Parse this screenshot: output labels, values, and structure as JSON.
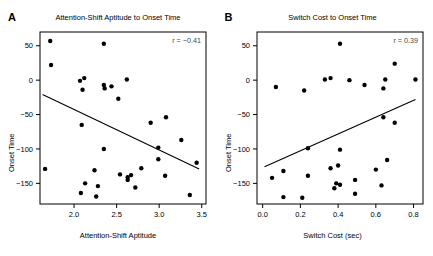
{
  "figure": {
    "background": "#ffffff",
    "point_color": "#000000",
    "line_color": "#000000"
  },
  "panels": [
    {
      "letter": "A",
      "title": "Attention-Shift Aptitude to Onset Time",
      "xlabel": "Attention-Shift Aptitude",
      "ylabel": "Onset Time",
      "annotation": "r = −0.41"
    },
    {
      "letter": "B",
      "title": "Switch Cost to Onset Time",
      "xlabel": "Switch Cost (sec)",
      "ylabel": "Onset Time",
      "annotation": "r = 0.39"
    }
  ],
  "chart_data": [
    {
      "type": "scatter",
      "panel": "A",
      "title": "Attention-Shift Aptitude to Onset Time",
      "xlabel": "Attention-Shift Aptitude",
      "ylabel": "Onset Time",
      "xlim": [
        1.6,
        3.55
      ],
      "ylim": [
        -180,
        70
      ],
      "xticks": [
        2.0,
        2.5,
        3.0,
        3.5
      ],
      "xticklabels": [
        "2.0",
        "2.5",
        "3.0",
        "3.5"
      ],
      "yticks": [
        50,
        0,
        -50,
        -100,
        -150
      ],
      "yticklabels": [
        "50",
        "0",
        "−50",
        "−100",
        "−150"
      ],
      "grid": false,
      "legend": false,
      "annotation": "r = −0.41",
      "correlation": -0.41,
      "trendline": {
        "x0": 1.63,
        "y0": -21,
        "x1": 3.47,
        "y1": -129
      },
      "points": [
        {
          "x": 1.72,
          "y": 57
        },
        {
          "x": 1.73,
          "y": 22
        },
        {
          "x": 2.35,
          "y": 53
        },
        {
          "x": 2.07,
          "y": -1
        },
        {
          "x": 2.12,
          "y": 3
        },
        {
          "x": 2.62,
          "y": 1
        },
        {
          "x": 2.35,
          "y": -7
        },
        {
          "x": 2.36,
          "y": -12
        },
        {
          "x": 2.44,
          "y": -9
        },
        {
          "x": 2.1,
          "y": -14
        },
        {
          "x": 2.52,
          "y": -27
        },
        {
          "x": 2.9,
          "y": -62
        },
        {
          "x": 3.08,
          "y": -54
        },
        {
          "x": 2.09,
          "y": -65
        },
        {
          "x": 3.26,
          "y": -87
        },
        {
          "x": 2.35,
          "y": -100
        },
        {
          "x": 2.99,
          "y": -98
        },
        {
          "x": 2.99,
          "y": -115
        },
        {
          "x": 3.44,
          "y": -120
        },
        {
          "x": 1.66,
          "y": -129
        },
        {
          "x": 2.79,
          "y": -128
        },
        {
          "x": 2.24,
          "y": -131
        },
        {
          "x": 2.54,
          "y": -137
        },
        {
          "x": 2.67,
          "y": -138
        },
        {
          "x": 2.63,
          "y": -141
        },
        {
          "x": 2.63,
          "y": -145
        },
        {
          "x": 3.07,
          "y": -139
        },
        {
          "x": 2.72,
          "y": -156
        },
        {
          "x": 2.13,
          "y": -150
        },
        {
          "x": 2.28,
          "y": -154
        },
        {
          "x": 2.08,
          "y": -164
        },
        {
          "x": 2.26,
          "y": -169
        },
        {
          "x": 3.36,
          "y": -167
        }
      ]
    },
    {
      "type": "scatter",
      "panel": "B",
      "title": "Switch Cost to Onset Time",
      "xlabel": "Switch Cost (sec)",
      "ylabel": "Onset Time",
      "xlim": [
        -0.03,
        0.85
      ],
      "ylim": [
        -180,
        70
      ],
      "xticks": [
        0.0,
        0.2,
        0.4,
        0.6,
        0.8
      ],
      "xticklabels": [
        "0.0",
        "0.2",
        "0.4",
        "0.6",
        "0.8"
      ],
      "yticks": [
        50,
        0,
        -50,
        -100,
        -150
      ],
      "yticklabels": [
        "50",
        "0",
        "−50",
        "−100",
        "−150"
      ],
      "grid": false,
      "legend": false,
      "annotation": "r = 0.39",
      "correlation": 0.39,
      "trendline": {
        "x0": 0.01,
        "y0": -126,
        "x1": 0.81,
        "y1": -28
      },
      "points": [
        {
          "x": 0.41,
          "y": 53
        },
        {
          "x": 0.7,
          "y": 24
        },
        {
          "x": 0.33,
          "y": 1
        },
        {
          "x": 0.36,
          "y": 3
        },
        {
          "x": 0.46,
          "y": 0
        },
        {
          "x": 0.65,
          "y": 1
        },
        {
          "x": 0.81,
          "y": 1
        },
        {
          "x": 0.07,
          "y": -10
        },
        {
          "x": 0.22,
          "y": -15
        },
        {
          "x": 0.54,
          "y": -7
        },
        {
          "x": 0.64,
          "y": -12
        },
        {
          "x": 0.64,
          "y": -54
        },
        {
          "x": 0.7,
          "y": -62
        },
        {
          "x": 0.24,
          "y": -99
        },
        {
          "x": 0.41,
          "y": -101
        },
        {
          "x": 0.66,
          "y": -116
        },
        {
          "x": 0.36,
          "y": -128
        },
        {
          "x": 0.4,
          "y": -124
        },
        {
          "x": 0.6,
          "y": -130
        },
        {
          "x": 0.11,
          "y": -132
        },
        {
          "x": 0.05,
          "y": -142
        },
        {
          "x": 0.24,
          "y": -139
        },
        {
          "x": 0.49,
          "y": -145
        },
        {
          "x": 0.39,
          "y": -150
        },
        {
          "x": 0.41,
          "y": -152
        },
        {
          "x": 0.63,
          "y": -153
        },
        {
          "x": 0.38,
          "y": -157
        },
        {
          "x": 0.49,
          "y": -165
        },
        {
          "x": 0.11,
          "y": -170
        },
        {
          "x": 0.21,
          "y": -171
        }
      ]
    }
  ]
}
